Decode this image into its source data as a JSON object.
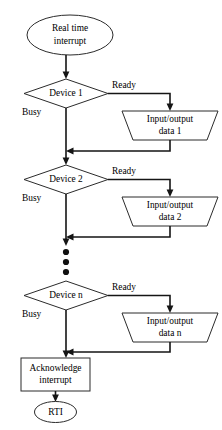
{
  "diagram": {
    "type": "flowchart",
    "colors": {
      "background": "#ffffff",
      "shape_stroke": "#2b2b2b",
      "line_stroke": "#151515",
      "text": "#000000"
    },
    "start_node": {
      "shape": "ellipse",
      "line1": "Real time",
      "line2": "interrupt"
    },
    "branches": [
      {
        "decision": "Device 1",
        "ready_label": "Ready",
        "busy_label": "Busy",
        "io_line1": "Input/output",
        "io_line2": "data 1"
      },
      {
        "decision": "Device 2",
        "ready_label": "Ready",
        "busy_label": "Busy",
        "io_line1": "Input/output",
        "io_line2": "data 2"
      },
      {
        "decision": "Device n",
        "ready_label": "Ready",
        "busy_label": "Busy",
        "io_line1": "Input/output",
        "io_line2": "data n"
      }
    ],
    "ellipsis": {
      "symbol": "vertical-dots",
      "count": 3
    },
    "process_node": {
      "shape": "rectangle",
      "line1": "Acknowledge",
      "line2": "interrupt"
    },
    "end_node": {
      "shape": "ellipse",
      "label": "RTI"
    }
  }
}
